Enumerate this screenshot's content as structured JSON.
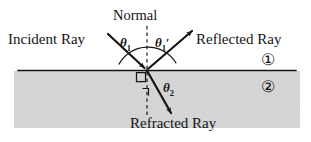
{
  "figure": {
    "background_color": "#ffffff",
    "ink_color": "#141414"
  },
  "labels": {
    "incident_ray": "Incident Ray",
    "normal": "Normal",
    "reflected_ray": "Reflected Ray",
    "refracted_ray": "Refracted Ray",
    "theta1": "θ",
    "theta1_sub": "1",
    "theta1_prime": "θ",
    "theta1_prime_sub": "1",
    "theta1_prime_mark": "′",
    "theta2": "θ",
    "theta2_sub": "2",
    "medium_1": "①",
    "medium_2": "②"
  },
  "geometry": {
    "interface_y": 70,
    "interface_x_start": 18,
    "interface_x_end": 296,
    "incidence_point_x": 147,
    "incidence_point_y": 70,
    "normal_top_y": 26,
    "normal_bottom_y": 115,
    "incident_ray_start": [
      110,
      36
    ],
    "incident_ray_end": [
      147,
      70
    ],
    "reflected_ray_start": [
      147,
      70
    ],
    "reflected_ray_end": [
      192,
      32
    ],
    "refracted_ray_start": [
      147,
      70
    ],
    "refracted_ray_end": [
      172,
      114
    ],
    "arc_radius": 31,
    "shaded_region": {
      "x": 14,
      "y": 71,
      "width": 286,
      "height": 57,
      "color": "#d6d6d6"
    }
  },
  "colors": {
    "medium_2_fill": "#d6d6d6",
    "line": "#141414",
    "dash": "#2a2a2a"
  }
}
